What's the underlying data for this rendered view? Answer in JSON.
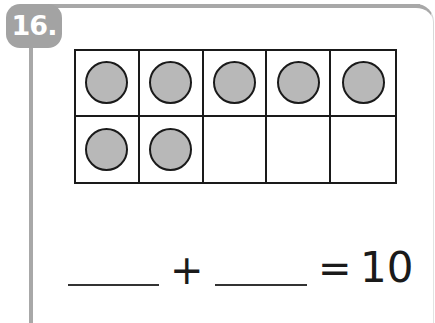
{
  "problem": {
    "number_label": "16.",
    "ten_frame": {
      "rows": 2,
      "columns": 5,
      "filled_count": 7,
      "cells": [
        {
          "filled": true
        },
        {
          "filled": true
        },
        {
          "filled": true
        },
        {
          "filled": true
        },
        {
          "filled": true
        },
        {
          "filled": true
        },
        {
          "filled": true
        },
        {
          "filled": false
        },
        {
          "filled": false
        },
        {
          "filled": false
        }
      ]
    },
    "equation": {
      "blank_1": "",
      "operator": "+",
      "blank_2": "",
      "equals": "=",
      "result": "10"
    }
  },
  "colors": {
    "badge": "#a3a3a3",
    "frame_border": "#a8a8a8",
    "counter_fill": "#b8b8b8",
    "line": "#1a1a1a"
  }
}
